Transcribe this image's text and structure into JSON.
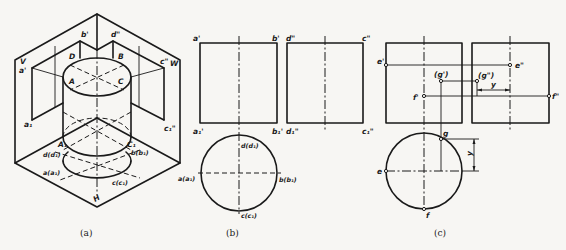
{
  "figure": {
    "panels": [
      {
        "id": "a",
        "caption": "(a)",
        "description": "Isometric view of cylinder within three projection planes",
        "labels": {
          "plane_v": "V",
          "plane_w": "W",
          "plane_h": "H",
          "a_prime": "a'",
          "b_prime": "b'",
          "d_double": "d\"",
          "c_double": "c\"",
          "A": "A",
          "B": "B",
          "C": "C",
          "D": "D",
          "a1": "a₁",
          "c1_double": "c₁\"",
          "A1": "A₁",
          "C1": "C₁",
          "d_d": "d(d₁)",
          "a_a": "a(a₁)",
          "b_b": "b(b₁)",
          "c_c": "c(c₁)"
        }
      },
      {
        "id": "b",
        "caption": "(b)",
        "description": "Three orthographic views of the cylinder",
        "labels": {
          "a_prime": "a'",
          "b_prime": "b'",
          "d_double": "d\"",
          "c_double": "c\"",
          "a1_prime": "a₁'",
          "b1_prime": "b₁'",
          "d1_double": "d₁\"",
          "c1_double": "c₁\"",
          "d_d": "d(d₁)",
          "a_a": "a(a₁)",
          "b_b": "b(b₁)",
          "c_c": "c(c₁)"
        }
      },
      {
        "id": "c",
        "caption": "(c)",
        "description": "Locating points on the cylinder surface",
        "labels": {
          "e_prime": "e'",
          "e_double": "e\"",
          "g_prime": "(g')",
          "g_double": "(g\")",
          "f_prime": "f'",
          "f_double": "f\"",
          "y_top": "y",
          "g": "g",
          "e": "e",
          "f": "f",
          "y_bottom": "y"
        }
      }
    ]
  }
}
